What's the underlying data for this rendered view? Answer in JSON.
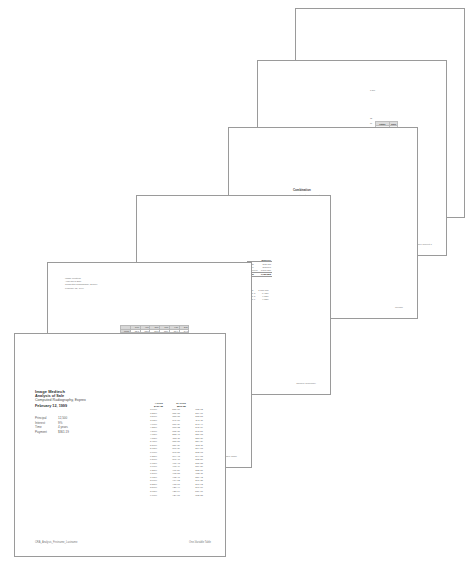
{
  "window": {
    "background": "#ffffff",
    "description": "Cascaded stack of six printed spreadsheet report pages"
  },
  "documents": {
    "front_report": {
      "name": "CRA_Analysis_Firstname_Lastname",
      "company": "Image Medtech",
      "title": "Analysis of Sale",
      "product": "Computed Radiography, Exprex",
      "date": "February 12, 1999",
      "parameters": [
        {
          "label": "Principal",
          "value": "12,500"
        },
        {
          "label": "Interest",
          "value": "9%"
        },
        {
          "label": "Time",
          "value": "4 years"
        },
        {
          "label": "Payment",
          "value": "$361.19"
        }
      ],
      "table": {
        "col_headers": [
          "4 years",
          "10 years"
        ],
        "totals": [
          "$461.35",
          "$279.80"
        ],
        "rows": [
          {
            "rate": "3.00%",
            "c4": "587.70",
            "c10": "372.02"
          },
          {
            "rate": "3.25%",
            "c4": "381.65",
            "c10": "219.77"
          },
          {
            "rate": "3.50%",
            "c4": "383.65",
            "c10": "238.53"
          },
          {
            "rate": "3.75%",
            "c4": "347.60",
            "c10": "241.11"
          },
          {
            "rate": "4.00%",
            "c4": "370.39",
            "c10": "243.44"
          },
          {
            "rate": "4.25%",
            "c4": "373.32",
            "c10": "245.79"
          },
          {
            "rate": "4.50%",
            "c4": "375.31",
            "c10": "248.57"
          },
          {
            "rate": "4.75%",
            "c4": "288.41",
            "c10": "251.18"
          },
          {
            "rate": "4.88%",
            "c4": "387.11",
            "c10": "253.30"
          },
          {
            "rate": "5.11%",
            "c4": "383.87",
            "c10": "254.39"
          },
          {
            "rate": "5.50%",
            "c4": "389.39",
            "c10": "262.11"
          },
          {
            "rate": "5.75%",
            "c4": "390.39",
            "c10": "264.03"
          },
          {
            "rate": "6.00%",
            "c4": "393.81",
            "c10": "262.03"
          },
          {
            "rate": "6.25%",
            "c4": "394.43",
            "c10": "244.68"
          },
          {
            "rate": "6.50%",
            "c4": "397.40",
            "c10": "272.50"
          },
          {
            "rate": "6.75%",
            "c4": "400.43",
            "c10": "275.88"
          },
          {
            "rate": "7.00%",
            "c4": "403.49",
            "c10": "279.80"
          },
          {
            "rate": "7.25%",
            "c4": "406.59",
            "c10": "282.87"
          },
          {
            "rate": "7.50%",
            "c4": "408.83",
            "c10": "085.11"
          },
          {
            "rate": "7.75%",
            "c4": "412.47",
            "c10": "289.42"
          },
          {
            "rate": "8.00%",
            "c4": "414.12",
            "c10": "291.35"
          },
          {
            "rate": "8.25%",
            "c4": "418.17",
            "c10": "290.92"
          },
          {
            "rate": "8.50%",
            "c4": "420.44",
            "c10": "297.66"
          },
          {
            "rate": "8.75%",
            "c4": "423.14",
            "c10": "589.71"
          },
          {
            "rate": "9.00%",
            "c4": "424.07",
            "c10": "302.88"
          }
        ]
      },
      "footer_left": "CRA_Analysis_Firstname_Lastname",
      "footer_right": "One-Variable Table"
    },
    "two_variable": {
      "header": "Image Medtech\nAnalysis of Sale\nComputed Radiography, Exprex\nFebruary 12, 1999",
      "footer_right": "Two-Variable Table",
      "grid": {
        "col_headers": [
          "",
          "3.0%",
          "4.0%",
          "5.0%",
          "6.0%",
          "7.0%",
          "8.0%"
        ],
        "row_headers": [
          "10,000",
          "10,500",
          "11,000",
          "11,500",
          "12,000",
          "12,500",
          "13,000",
          "13,500",
          "14,000",
          "14,500",
          "15,000",
          "15,500",
          "16,000",
          "16,500",
          "17,000",
          "17,500",
          "18,000",
          "18,500",
          "19,000",
          "19,500",
          "20,000",
          "20,500",
          "21,000",
          "21,500",
          "22,000",
          "22,500",
          "23,000",
          "23,500",
          "24,000",
          "25,000"
        ],
        "cells": [
          [
            "221.3",
            "225.8",
            "230.3",
            "235.0",
            "239.7",
            "244.5"
          ],
          [
            "232.4",
            "237.1",
            "241.9",
            "246.7",
            "251.7",
            "256.7"
          ],
          [
            "243.5",
            "248.4",
            "253.4",
            "258.5",
            "263.6",
            "268.9"
          ],
          [
            "254.5",
            "259.7",
            "264.9",
            "270.2",
            "275.6",
            "281.1"
          ],
          [
            "265.6",
            "271.0",
            "276.4",
            "281.9",
            "287.6",
            "293.3"
          ],
          [
            "276.7",
            "282.3",
            "287.9",
            "293.7",
            "299.5",
            "305.5"
          ],
          [
            "287.7",
            "293.5",
            "299.4",
            "305.4",
            "311.5",
            "317.7"
          ],
          [
            "298.8",
            "304.8",
            "311.0",
            "317.2",
            "323.5",
            "329.9"
          ],
          [
            "309.9",
            "316.1",
            "322.5",
            "328.9",
            "335.4",
            "342.1"
          ],
          [
            "320.9",
            "327.4",
            "334.0",
            "340.7",
            "347.4",
            "354.3"
          ],
          [
            "332.0",
            "338.7",
            "345.5",
            "352.4",
            "359.4",
            "366.5"
          ],
          [
            "343.1",
            "350.0",
            "357.0",
            "364.2",
            "371.4",
            "378.7"
          ],
          [
            "354.1",
            "361.3",
            "368.5",
            "375.9",
            "383.4",
            "390.9"
          ],
          [
            "365.2",
            "372.6",
            "380.1",
            "387.7",
            "395.3",
            "403.1"
          ],
          [
            "376.3",
            "383.9",
            "391.6",
            "399.4",
            "407.3",
            "415.3"
          ],
          [
            "387.3",
            "395.2",
            "403.1",
            "411.2",
            "419.3",
            "427.5"
          ],
          [
            "398.4",
            "406.5",
            "414.6",
            "422.9",
            "431.3",
            "439.7"
          ],
          [
            "409.5",
            "417.8",
            "426.2",
            "434.7",
            "443.2",
            "451.9"
          ],
          [
            "420.5",
            "429.1",
            "437.7",
            "446.4",
            "455.2",
            "464.1"
          ],
          [
            "431.6",
            "440.4",
            "449.2",
            "458.2",
            "467.2",
            "476.3"
          ],
          [
            "442.7",
            "451.7",
            "460.7",
            "469.9",
            "479.2",
            "488.5"
          ],
          [
            "453.7",
            "462.9",
            "472.3",
            "481.7",
            "491.1",
            "500.7"
          ],
          [
            "464.8",
            "474.2",
            "483.8",
            "493.4",
            "503.1",
            "512.9"
          ],
          [
            "475.9",
            "485.5",
            "495.3",
            "505.2",
            "515.1",
            "525.1"
          ],
          [
            "486.9",
            "496.8",
            "506.8",
            "516.9",
            "527.1",
            "537.3"
          ],
          [
            "498.0",
            "508.1",
            "518.4",
            "528.7",
            "539.0",
            "549.5"
          ],
          [
            "509.1",
            "519.4",
            "529.9",
            "540.4",
            "551.0",
            "561.7"
          ],
          [
            "520.1",
            "530.7",
            "541.4",
            "552.2",
            "563.0",
            "573.9"
          ],
          [
            "531.2",
            "542.0",
            "552.9",
            "563.9",
            "575.0",
            "586.1"
          ],
          [
            "553.3",
            "564.6",
            "575.9",
            "587.4",
            "598.9",
            "610.5"
          ]
        ]
      }
    },
    "sample_summary": {
      "footer_right": "Sample Summary",
      "table": {
        "head": [
          "",
          "Baseline"
        ],
        "rows": [
          {
            "label": "Units",
            "value": "362,437"
          },
          {
            "label": "Price",
            "value": "363,100"
          },
          {
            "label": "Revenue",
            "value": "1,566,720"
          },
          {
            "label": "Total",
            "value": "1,986,285"
          }
        ],
        "extra": [
          {
            "label": "Goal",
            "value": "1,000,000"
          },
          {
            "label": "Rate a",
            "value": "6.43%"
          },
          {
            "label": "Rate b",
            "value": "4.03%"
          },
          {
            "label": "Rate c",
            "value": "4.03%"
          }
        ]
      }
    },
    "combination": {
      "title": "Combination",
      "footer_right": "Combo",
      "table": {
        "head": [
          "Input Cost",
          "Combination"
        ],
        "rows": [
          {
            "a": "$502.68",
            "b": "$402.68"
          },
          {
            "a": "60",
            "b": "9"
          },
          {
            "a": "1.25%",
            "b": "7%"
          }
        ]
      },
      "sub_rows": [
        {
          "a": "$3,625.00",
          "b": "$1,382.57"
        },
        {
          "a": "$2,620.40",
          "b": "$982,952.41"
        }
      ]
    },
    "answer_report": {
      "footer_right": "Answer Report 1",
      "constraint_table": {
        "head": [
          "Cell",
          "Name",
          "Cell Value",
          "Formula",
          "Status",
          "Slack"
        ],
        "rows": [
          {
            "status": "Not Binding",
            "slack": "1000"
          },
          {
            "status": "Not Binding",
            "slack": "1.0"
          },
          {
            "status": "Not Binding",
            "slack": "1.0"
          },
          {
            "status": "Not Binding",
            "slack": "1.0"
          },
          {
            "status": "Not Binding",
            "slack": "1.0"
          },
          {
            "status": "Not Binding",
            "slack": "1.0"
          },
          {
            "status": "Binding",
            "slack": "0"
          },
          {
            "status": "Binding",
            "slack": "0"
          },
          {
            "status": "Binding",
            "slack": "0"
          },
          {
            "status": "Not Binding",
            "slack": "17"
          },
          {
            "status": "Not Binding",
            "slack": "38"
          },
          {
            "status": "Not Binding",
            "slack": "31"
          }
        ]
      }
    },
    "top_sheet": {
      "header_lines": [
        "Microsoft Excel 10.0 Answer Report",
        "Worksheet: [US_Manufacturing_Firstname_Lastname.fix.xls]Shell",
        "Report Created: 5/5/2007 3:11:29 PM"
      ]
    }
  }
}
